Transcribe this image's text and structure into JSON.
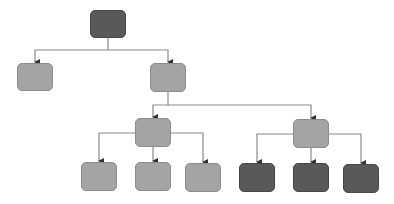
{
  "diagram": {
    "type": "tree",
    "colors": {
      "light": "#a4a4a4",
      "dark": "#595959",
      "connector": "#8a8a8a",
      "arrow": "#333333"
    },
    "nodes": [
      {
        "id": "root",
        "level": 0,
        "style": "dark",
        "x": 90,
        "y": 10,
        "w": 36,
        "h": 28,
        "label": ""
      },
      {
        "id": "l1-left",
        "level": 1,
        "style": "light",
        "x": 17,
        "y": 63,
        "w": 36,
        "h": 28,
        "label": ""
      },
      {
        "id": "l1-right",
        "level": 1,
        "style": "light",
        "x": 150,
        "y": 63,
        "w": 36,
        "h": 29,
        "label": ""
      },
      {
        "id": "l2-left",
        "level": 2,
        "style": "light",
        "x": 135,
        "y": 118,
        "w": 36,
        "h": 29,
        "label": ""
      },
      {
        "id": "l2-right",
        "level": 2,
        "style": "light",
        "x": 293,
        "y": 119,
        "w": 36,
        "h": 29,
        "label": ""
      },
      {
        "id": "l3-1",
        "level": 3,
        "style": "light",
        "x": 81,
        "y": 162,
        "w": 36,
        "h": 29,
        "label": ""
      },
      {
        "id": "l3-2",
        "level": 3,
        "style": "light",
        "x": 135,
        "y": 162,
        "w": 36,
        "h": 29,
        "label": ""
      },
      {
        "id": "l3-3",
        "level": 3,
        "style": "light",
        "x": 185,
        "y": 163,
        "w": 36,
        "h": 29,
        "label": ""
      },
      {
        "id": "l3-4",
        "level": 3,
        "style": "dark",
        "x": 239,
        "y": 163,
        "w": 36,
        "h": 29,
        "label": ""
      },
      {
        "id": "l3-5",
        "level": 3,
        "style": "dark",
        "x": 293,
        "y": 163,
        "w": 36,
        "h": 29,
        "label": ""
      },
      {
        "id": "l3-6",
        "level": 3,
        "style": "dark",
        "x": 343,
        "y": 164,
        "w": 36,
        "h": 29,
        "label": ""
      }
    ],
    "edges": [
      [
        "root",
        "l1-left"
      ],
      [
        "root",
        "l1-right"
      ],
      [
        "l1-right",
        "l2-left"
      ],
      [
        "l1-right",
        "l2-right"
      ],
      [
        "l2-left",
        "l3-1"
      ],
      [
        "l2-left",
        "l3-2"
      ],
      [
        "l2-left",
        "l3-3"
      ],
      [
        "l2-right",
        "l3-4"
      ],
      [
        "l2-right",
        "l3-5"
      ],
      [
        "l2-right",
        "l3-6"
      ]
    ]
  }
}
